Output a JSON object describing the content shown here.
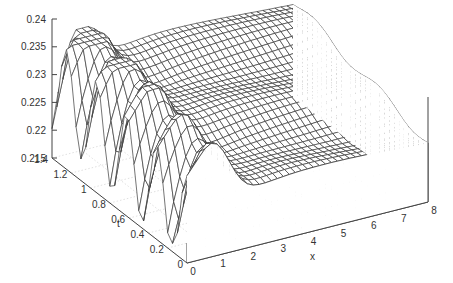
{
  "chart_data": {
    "type": "surface3d",
    "title": "",
    "xlabel": "x",
    "ylabel": "t",
    "zlabel": "",
    "xlim": [
      0,
      8
    ],
    "ylim": [
      0,
      1.4
    ],
    "zlim": [
      0.215,
      0.24
    ],
    "x_ticks": [
      "0",
      "1",
      "2",
      "3",
      "4",
      "5",
      "6",
      "7",
      "8"
    ],
    "t_ticks": [
      "0",
      "0.2",
      "0.4",
      "0.6",
      "0.8",
      "1",
      "1.2",
      "1.4"
    ],
    "z_ticks": [
      "0.215",
      "0.22",
      "0.225",
      "0.23",
      "0.235",
      "0.24"
    ],
    "grid": true,
    "style": "wireframe hidden3d",
    "grid_resolution": {
      "nx": 41,
      "nt": 29
    },
    "surface_samples": {
      "x": [
        0,
        1,
        2,
        3,
        4,
        5,
        6,
        7,
        8
      ],
      "t0_values": [
        0.2205,
        0.2335,
        0.225,
        0.2225,
        0.2235,
        0.2245,
        0.225,
        0.2255,
        0.226
      ],
      "t1.4_values": [
        0.2215,
        0.2355,
        0.2345,
        0.233,
        0.2325,
        0.232,
        0.2315,
        0.231,
        0.2305
      ]
    }
  },
  "axes": {
    "z_label_text": "",
    "t_label_text": "t",
    "x_label_text": "x"
  }
}
